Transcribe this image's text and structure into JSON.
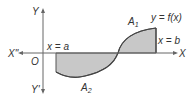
{
  "diagram": {
    "axes": {
      "y_top": "Y",
      "y_bottom": "Y'",
      "x_left": "X\"",
      "x_right": "X",
      "origin": "O"
    },
    "lines": {
      "left_bound": "x = a",
      "right_bound": "x = b",
      "curve": "y = f(x)"
    },
    "regions": {
      "above_label": "A",
      "above_sub": "1",
      "below_label": "A",
      "below_sub": "2"
    },
    "colors": {
      "fill": "#c8c8c8",
      "stroke": "#555555",
      "axis": "#666666"
    }
  }
}
